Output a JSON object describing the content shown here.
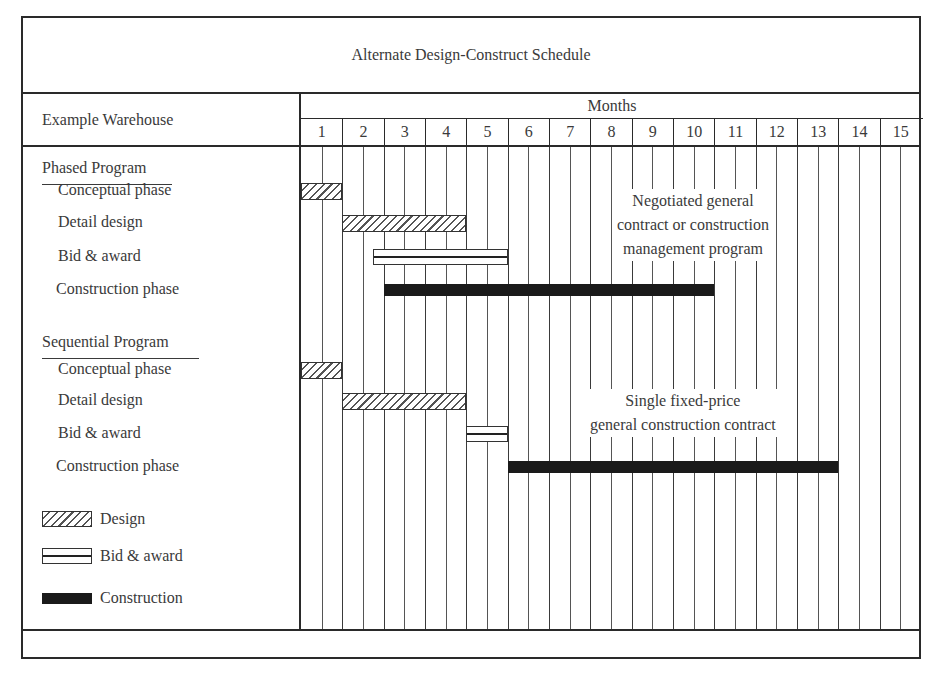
{
  "chart_data": {
    "type": "gantt",
    "title": "Alternate Design-Construct Schedule",
    "row_header": "Example Warehouse",
    "xlabel": "Months",
    "x_ticks": [
      "1",
      "2",
      "3",
      "4",
      "5",
      "6",
      "7",
      "8",
      "9",
      "10",
      "11",
      "12",
      "13",
      "14",
      "15"
    ],
    "xlim": [
      0,
      15
    ],
    "grid": "vertical lines at every half month",
    "groups": [
      {
        "name": "Phased Program",
        "annotation": [
          "Negotiated general",
          "contract or construction",
          "management program"
        ],
        "tasks": [
          {
            "name": "Conceptual phase",
            "type": "Design",
            "start": 0,
            "end": 1
          },
          {
            "name": "Detail design",
            "type": "Design",
            "start": 1,
            "end": 4
          },
          {
            "name": "Bid & award",
            "type": "Bid & award",
            "start": 1.75,
            "end": 5
          },
          {
            "name": "Construction phase",
            "type": "Construction",
            "start": 2,
            "end": 10
          }
        ]
      },
      {
        "name": "Sequential Program",
        "annotation": [
          "Single fixed-price",
          "general construction contract"
        ],
        "tasks": [
          {
            "name": "Conceptual phase",
            "type": "Design",
            "start": 0,
            "end": 1
          },
          {
            "name": "Detail design",
            "type": "Design",
            "start": 1,
            "end": 4
          },
          {
            "name": "Bid & award",
            "type": "Bid & award",
            "start": 4,
            "end": 5
          },
          {
            "name": "Construction phase",
            "type": "Construction",
            "start": 5,
            "end": 13
          }
        ]
      }
    ],
    "legend": [
      {
        "label": "Design",
        "style": "hatched"
      },
      {
        "label": "Bid & award",
        "style": "double-line"
      },
      {
        "label": "Construction",
        "style": "solid black"
      }
    ]
  }
}
